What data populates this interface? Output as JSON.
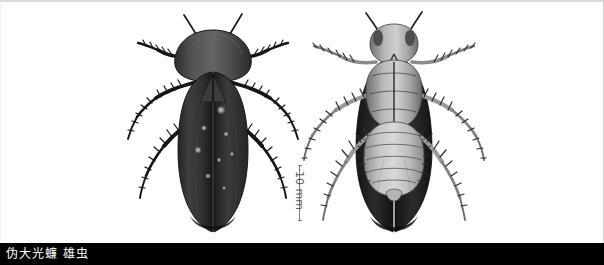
{
  "plate": {
    "type": "scientific-specimen-photograph",
    "background_color": "#ffffff",
    "frame_color": "#d9d9d9",
    "width": 604,
    "height": 265
  },
  "caption": {
    "text": "伪大光蠊 雄虫",
    "text_color": "#ffffff",
    "background_color": "#000000"
  },
  "scale": {
    "label": "10 mm",
    "value": 10,
    "unit": "mm",
    "orientation": "vertical",
    "color": "#5a5a5a"
  },
  "specimens": [
    {
      "id": "dorsal",
      "view": "dorsal",
      "description": "cockroach viewed from above, dark brown tegmina covering abdomen",
      "body_color": "#3a3a3a",
      "pronotum_color": "#4a4a4a",
      "wing_color": "#2e2e2e"
    },
    {
      "id": "ventral",
      "view": "ventral",
      "description": "cockroach viewed from below, pale segmented abdomen and legs",
      "body_color": "#9a9a9a",
      "abdomen_color": "#c8c8c8",
      "wing_color": "#1e1e1e"
    }
  ]
}
